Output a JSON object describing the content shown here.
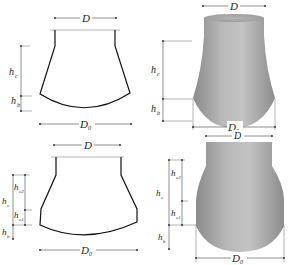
{
  "figure": {
    "panels": [
      {
        "id": "a",
        "style": "line-drawing",
        "shape": "conical tower with curved base",
        "labels": {
          "top_diameter": {
            "main": "D",
            "sub": ""
          },
          "base_diameter": {
            "main": "D",
            "sub": "0"
          },
          "height_c": {
            "main": "h",
            "sub": "c"
          },
          "height_b": {
            "main": "h",
            "sub": "b"
          }
        }
      },
      {
        "id": "b",
        "style": "3d-shaded",
        "shape": "conical tower with spherical cap base",
        "labels": {
          "top_diameter": {
            "main": "D",
            "sub": ""
          },
          "base_diameter": {
            "main": "D",
            "sub": "0"
          },
          "height_c": {
            "main": "h",
            "sub": "c"
          },
          "height_b": {
            "main": "h",
            "sub": "b"
          }
        }
      },
      {
        "id": "c",
        "style": "line-drawing",
        "shape": "two-segment conical tower with curved base",
        "labels": {
          "top_diameter": {
            "main": "D",
            "sub": ""
          },
          "base_diameter": {
            "main": "D",
            "sub": "0"
          },
          "height_c": {
            "main": "h",
            "sub": "c"
          },
          "height_c1": {
            "main": "h",
            "sub": "c1"
          },
          "height_c2": {
            "main": "h",
            "sub": "c2"
          },
          "height_b": {
            "main": "h",
            "sub": "b"
          }
        }
      },
      {
        "id": "d",
        "style": "3d-shaded",
        "shape": "two-segment tower with spherical cap base",
        "labels": {
          "top_diameter": {
            "main": "D",
            "sub": ""
          },
          "base_diameter": {
            "main": "D",
            "sub": "0"
          },
          "height_c": {
            "main": "h",
            "sub": "c"
          },
          "height_c1": {
            "main": "h",
            "sub": "c1"
          },
          "height_c2": {
            "main": "h",
            "sub": "c2"
          },
          "height_b": {
            "main": "h",
            "sub": "b"
          }
        }
      }
    ],
    "colors": {
      "line": "#111111",
      "shade_light": "#c8c8c8",
      "shade_mid": "#a9a9a9",
      "shade_dark": "#7a7a7a",
      "background": "#ffffff"
    }
  }
}
